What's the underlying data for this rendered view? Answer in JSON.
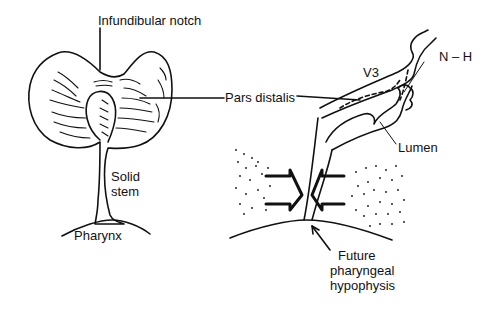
{
  "diagram": {
    "left_panel": {
      "labels": {
        "infundibular_notch": "Infundibular notch",
        "solid_stem_1": "Solid",
        "solid_stem_2": "stem",
        "pharynx": "Pharynx"
      }
    },
    "shared_labels": {
      "pars_distalis": "Pars distalis"
    },
    "right_panel": {
      "labels": {
        "v3": "V3",
        "n_h": "N – H",
        "lumen": "Lumen",
        "future_1": "Future",
        "future_2": "pharyngeal",
        "future_3": "hypophysis"
      }
    },
    "colors": {
      "stroke": "#111111",
      "background": "#ffffff"
    }
  }
}
